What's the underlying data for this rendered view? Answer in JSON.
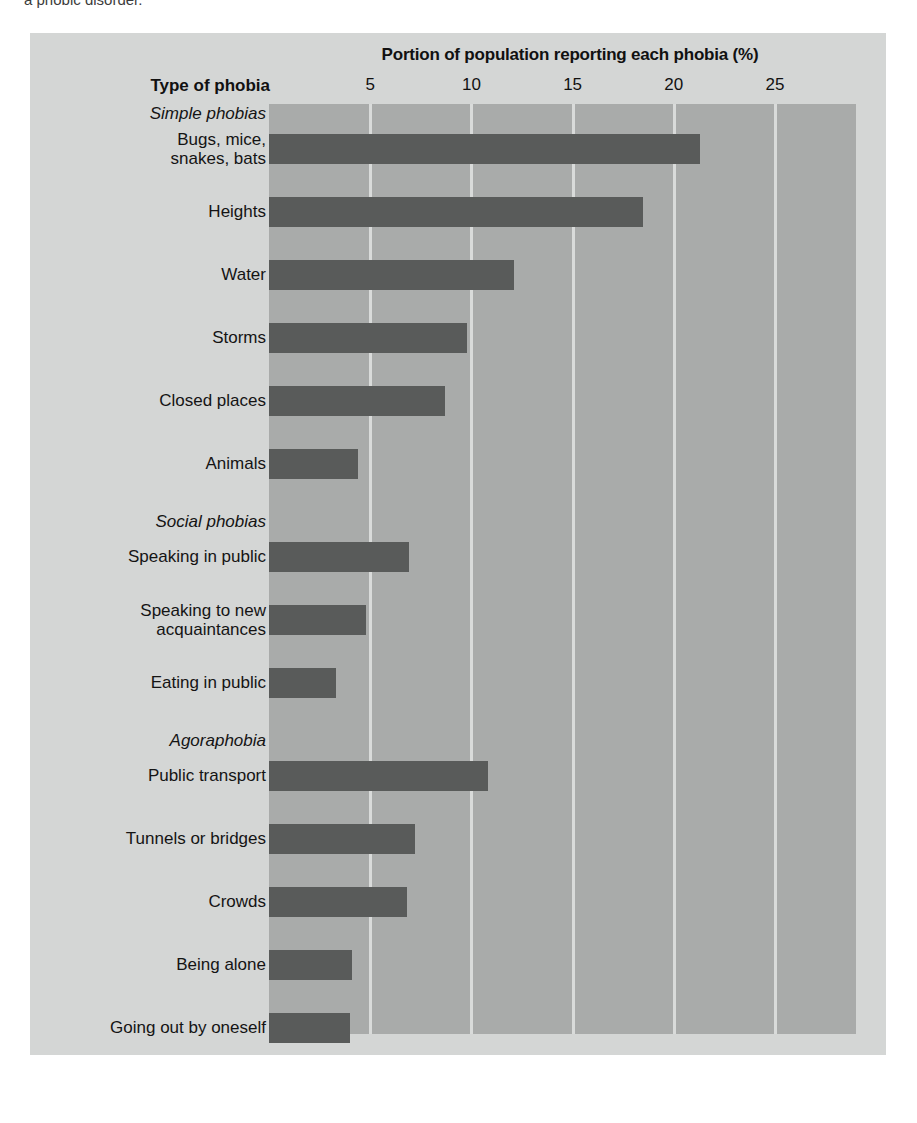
{
  "page": {
    "top_fragment_left": "a phobic disorder.",
    "top_fragment_right": "p            , y     y"
  },
  "chart": {
    "title": "Portion of population reporting each phobia (%)",
    "category_axis_title": "Type of phobia"
  },
  "chart_data": {
    "type": "bar",
    "orientation": "horizontal",
    "title": "Portion of population reporting each phobia (%)",
    "xlabel": "Portion of population reporting each phobia (%)",
    "ylabel": "Type of phobia",
    "xlim": [
      0,
      29
    ],
    "xticks": [
      5,
      10,
      15,
      20,
      25
    ],
    "xtick_labels": [
      "5",
      "10",
      "15",
      "20",
      "25"
    ],
    "grid": true,
    "legend": "none",
    "bar_color": "#595b5a",
    "plot_background": "#a9abaa",
    "panel_background": "#d4d6d5",
    "groups": [
      {
        "name": "Simple phobias",
        "categories": [
          "Bugs, mice,\nsnakes, bats",
          "Heights",
          "Water",
          "Storms",
          "Closed places",
          "Animals"
        ],
        "values": [
          21.3,
          18.5,
          12.1,
          9.8,
          8.7,
          4.4
        ]
      },
      {
        "name": "Social phobias",
        "categories": [
          "Speaking in public",
          "Speaking to new\nacquaintances",
          "Eating in public"
        ],
        "values": [
          6.9,
          4.8,
          3.3
        ]
      },
      {
        "name": "Agoraphobia",
        "categories": [
          "Public transport",
          "Tunnels or bridges",
          "Crowds",
          "Being alone",
          "Going out by oneself"
        ],
        "values": [
          10.8,
          7.2,
          6.8,
          4.1,
          4.0
        ]
      }
    ],
    "categories": [
      "Bugs, mice,\nsnakes, bats",
      "Heights",
      "Water",
      "Storms",
      "Closed places",
      "Animals",
      "Speaking in public",
      "Speaking to new\nacquaintances",
      "Eating in public",
      "Public transport",
      "Tunnels or bridges",
      "Crowds",
      "Being alone",
      "Going out by oneself"
    ],
    "values": [
      21.3,
      18.5,
      12.1,
      9.8,
      8.7,
      4.4,
      6.9,
      4.8,
      3.3,
      10.8,
      7.2,
      6.8,
      4.1,
      4.0
    ]
  }
}
